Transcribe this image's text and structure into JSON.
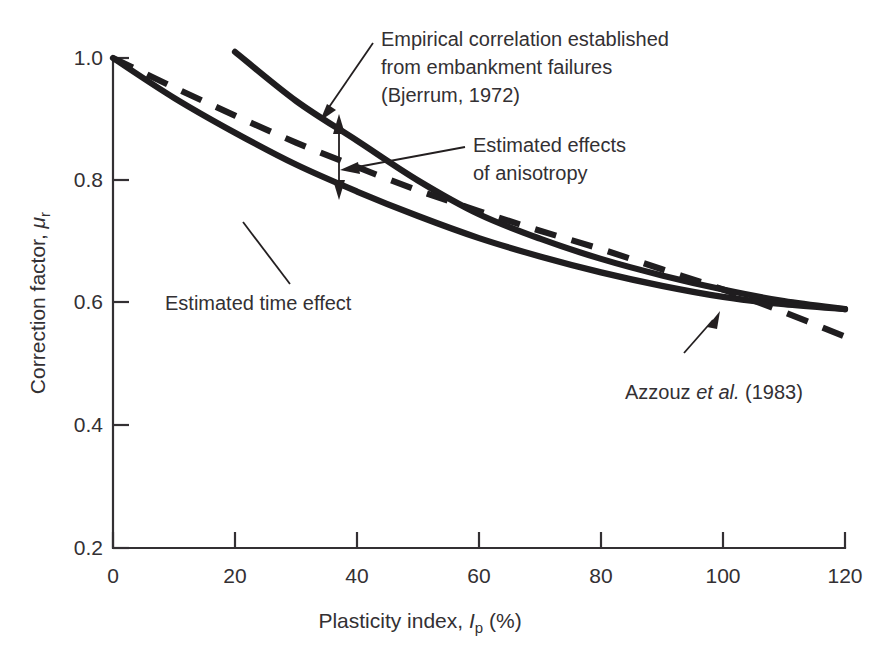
{
  "chart_data": {
    "type": "line",
    "title": "",
    "xlabel": "Plasticity index, Ip (%)",
    "ylabel": "Correction factor, μr",
    "xlim": [
      0,
      120
    ],
    "ylim": [
      0.2,
      1.0
    ],
    "grid": false,
    "legend": "none",
    "xticks": [
      "0",
      "20",
      "40",
      "60",
      "80",
      "100",
      "120"
    ],
    "xtick_values": [
      0,
      20,
      40,
      60,
      80,
      100,
      120
    ],
    "yticks": [
      "0.2",
      "0.4",
      "0.6",
      "0.8",
      "1.0"
    ],
    "ytick_values": [
      0.2,
      0.4,
      0.6,
      0.8,
      1.0
    ],
    "series": [
      {
        "name": "Empirical correlation established from embankment failures (Bjerrum, 1972)",
        "style": "solid",
        "x": [
          20,
          30,
          40,
          50,
          60,
          70,
          80,
          90,
          100,
          110,
          120
        ],
        "values": [
          1.01,
          0.93,
          0.865,
          0.8,
          0.745,
          0.705,
          0.672,
          0.645,
          0.622,
          0.603,
          0.59
        ]
      },
      {
        "name": "Estimated time effect",
        "style": "solid",
        "x": [
          0,
          10,
          20,
          30,
          40,
          50,
          60,
          70,
          80,
          90,
          100,
          110,
          120
        ],
        "values": [
          1.0,
          0.935,
          0.878,
          0.826,
          0.782,
          0.742,
          0.706,
          0.676,
          0.65,
          0.628,
          0.61,
          0.598,
          0.59
        ]
      },
      {
        "name": "Azzouz et al. (1983)",
        "style": "dashed",
        "x": [
          0,
          10,
          20,
          30,
          40,
          50,
          60,
          70,
          80,
          90,
          100,
          110,
          120
        ],
        "values": [
          1.0,
          0.952,
          0.906,
          0.862,
          0.822,
          0.784,
          0.75,
          0.718,
          0.688,
          0.655,
          0.622,
          0.585,
          0.545
        ]
      }
    ],
    "annotations": [
      {
        "name": "bjerrum-annotation",
        "lines": [
          "Empirical correlation established",
          "from embankment failures",
          "(Bjerrum, 1972)"
        ],
        "has_arrow": true
      },
      {
        "name": "anisotropy-annotation",
        "lines": [
          "Estimated effects",
          "of anisotropy"
        ],
        "has_arrow": true
      },
      {
        "name": "time-effect-annotation",
        "lines": [
          "Estimated time effect"
        ],
        "has_arrow": false
      },
      {
        "name": "azzouz-annotation",
        "text_pre": "Azzouz ",
        "text_italic": "et al.",
        "text_post": " (1983)",
        "has_arrow": true
      }
    ]
  },
  "axes": {
    "y_label_pre": "Correction factor, ",
    "y_label_symbol": "μ",
    "y_label_sub": "r",
    "x_label_pre": "Plasticity index, ",
    "x_label_symbol": "I",
    "x_label_sub": "p",
    "x_label_post": " (%)"
  },
  "colors": {
    "ink": "#231f20",
    "curve": "#1f1d1f",
    "background": "#ffffff"
  }
}
